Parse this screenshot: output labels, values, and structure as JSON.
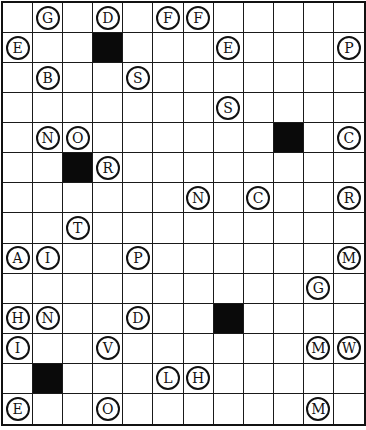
{
  "puzzle": {
    "cols": 12,
    "rows": 14,
    "colors": {
      "grid_line": "#1a1a1a",
      "black_cell": "#0a0a0a",
      "background": "#ffffff"
    },
    "black_cells": [
      [
        1,
        3
      ],
      [
        4,
        9
      ],
      [
        5,
        2
      ],
      [
        10,
        7
      ],
      [
        12,
        1
      ]
    ],
    "circled_letters": [
      {
        "row": 0,
        "col": 1,
        "letter": "G"
      },
      {
        "row": 0,
        "col": 3,
        "letter": "D"
      },
      {
        "row": 0,
        "col": 5,
        "letter": "F"
      },
      {
        "row": 0,
        "col": 6,
        "letter": "F"
      },
      {
        "row": 1,
        "col": 0,
        "letter": "E"
      },
      {
        "row": 1,
        "col": 7,
        "letter": "E"
      },
      {
        "row": 1,
        "col": 11,
        "letter": "P"
      },
      {
        "row": 2,
        "col": 1,
        "letter": "B"
      },
      {
        "row": 2,
        "col": 4,
        "letter": "S"
      },
      {
        "row": 3,
        "col": 7,
        "letter": "S"
      },
      {
        "row": 4,
        "col": 1,
        "letter": "N"
      },
      {
        "row": 4,
        "col": 2,
        "letter": "O"
      },
      {
        "row": 4,
        "col": 11,
        "letter": "C"
      },
      {
        "row": 5,
        "col": 3,
        "letter": "R"
      },
      {
        "row": 6,
        "col": 6,
        "letter": "N"
      },
      {
        "row": 6,
        "col": 8,
        "letter": "C"
      },
      {
        "row": 6,
        "col": 11,
        "letter": "R"
      },
      {
        "row": 7,
        "col": 2,
        "letter": "T"
      },
      {
        "row": 8,
        "col": 0,
        "letter": "A"
      },
      {
        "row": 8,
        "col": 1,
        "letter": "I"
      },
      {
        "row": 8,
        "col": 4,
        "letter": "P"
      },
      {
        "row": 8,
        "col": 11,
        "letter": "M"
      },
      {
        "row": 9,
        "col": 10,
        "letter": "G"
      },
      {
        "row": 10,
        "col": 0,
        "letter": "H"
      },
      {
        "row": 10,
        "col": 1,
        "letter": "N"
      },
      {
        "row": 10,
        "col": 4,
        "letter": "D"
      },
      {
        "row": 11,
        "col": 0,
        "letter": "I"
      },
      {
        "row": 11,
        "col": 3,
        "letter": "V"
      },
      {
        "row": 11,
        "col": 10,
        "letter": "M"
      },
      {
        "row": 11,
        "col": 11,
        "letter": "W"
      },
      {
        "row": 12,
        "col": 5,
        "letter": "L"
      },
      {
        "row": 12,
        "col": 6,
        "letter": "H"
      },
      {
        "row": 13,
        "col": 0,
        "letter": "E"
      },
      {
        "row": 13,
        "col": 3,
        "letter": "O"
      },
      {
        "row": 13,
        "col": 10,
        "letter": "M"
      }
    ]
  }
}
